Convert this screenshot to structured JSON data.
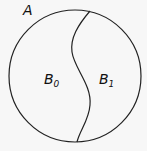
{
  "diagram": {
    "set_label": "A",
    "regions": [
      {
        "label": "B",
        "subscript": "0"
      },
      {
        "label": "B",
        "subscript": "1"
      }
    ],
    "colors": {
      "stroke": "#222222",
      "background": "#f7f7f7"
    }
  }
}
